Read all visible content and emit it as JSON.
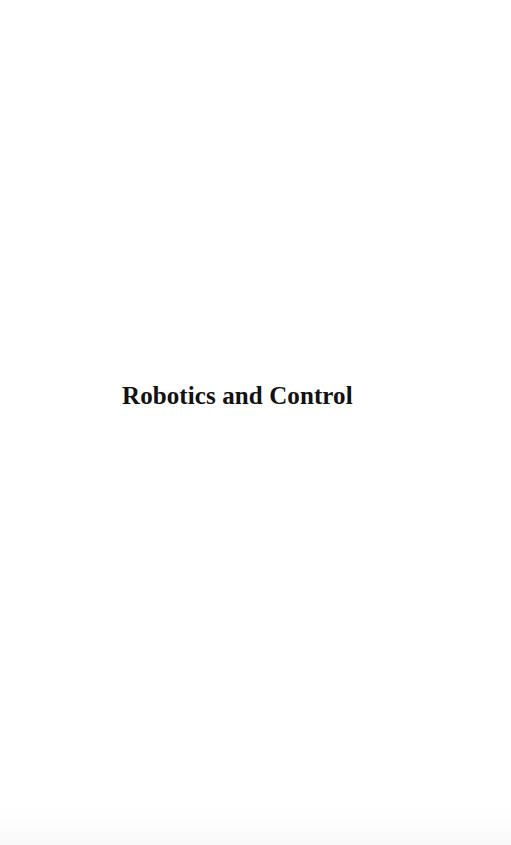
{
  "page": {
    "title": "Robotics and Control"
  }
}
